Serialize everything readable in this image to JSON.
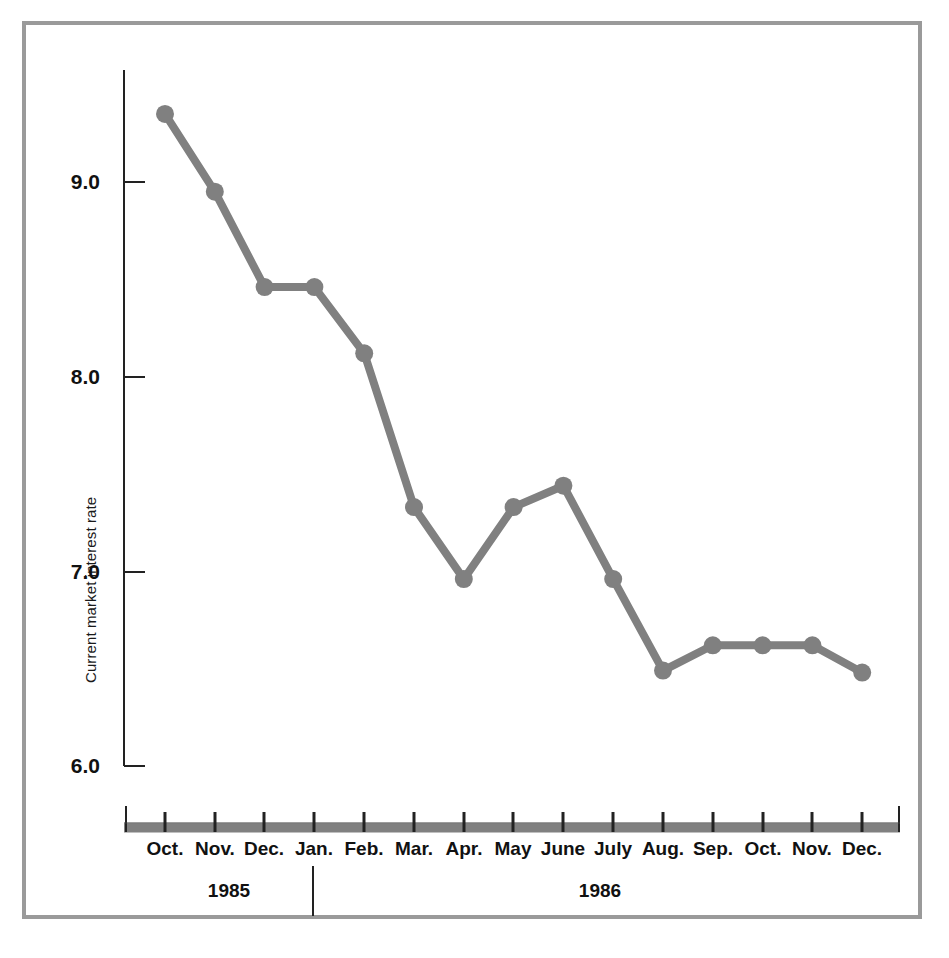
{
  "chart_data": {
    "type": "line",
    "title": "",
    "subtitle": "",
    "xlabel": "",
    "ylabel": "Current market interest rate",
    "categories": [
      "Oct.",
      "Nov.",
      "Dec.",
      "Jan.",
      "Feb.",
      "Mar.",
      "Apr.",
      "May",
      "June",
      "July",
      "Aug.",
      "Sep.",
      "Oct.",
      "Nov.",
      "Dec."
    ],
    "values": [
      9.35,
      8.95,
      8.46,
      8.46,
      8.12,
      7.33,
      6.96,
      7.33,
      7.44,
      6.96,
      6.49,
      6.62,
      6.62,
      6.62,
      6.48
    ],
    "ytick_labels": [
      "9.0",
      "8.0",
      "7.0",
      "6.0"
    ],
    "ytick_values": [
      9.0,
      8.0,
      7.0,
      6.0
    ],
    "ylim": [
      6.0,
      9.6
    ],
    "xlim_labels": [
      "Oct.",
      "Dec."
    ],
    "grid": false,
    "legend": "none",
    "markers": "circle",
    "series": [
      {
        "name": "Current market interest rate",
        "values": [
          9.35,
          8.95,
          8.46,
          8.46,
          8.12,
          7.33,
          6.96,
          7.33,
          7.44,
          6.96,
          6.49,
          6.62,
          6.62,
          6.62,
          6.48
        ]
      }
    ],
    "period_groups": [
      {
        "label": "1985",
        "months": [
          "Oct.",
          "Nov.",
          "Dec."
        ]
      },
      {
        "label": "1986",
        "months": [
          "Jan.",
          "Feb.",
          "Mar.",
          "Apr.",
          "May",
          "June",
          "July",
          "Aug.",
          "Sep.",
          "Oct.",
          "Nov.",
          "Dec."
        ]
      }
    ]
  },
  "axis": {
    "y_title": "Current market interest rate",
    "y_ticks": [
      {
        "label": "9.0"
      },
      {
        "label": "8.0"
      },
      {
        "label": "7.0"
      },
      {
        "label": "6.0"
      }
    ],
    "x_ticks": [
      {
        "label": "Oct."
      },
      {
        "label": "Nov."
      },
      {
        "label": "Dec."
      },
      {
        "label": "Jan."
      },
      {
        "label": "Feb."
      },
      {
        "label": "Mar."
      },
      {
        "label": "Apr."
      },
      {
        "label": "May"
      },
      {
        "label": "June"
      },
      {
        "label": "July"
      },
      {
        "label": "Aug."
      },
      {
        "label": "Sep."
      },
      {
        "label": "Oct."
      },
      {
        "label": "Nov."
      },
      {
        "label": "Dec."
      }
    ]
  },
  "years": [
    {
      "label": "1985"
    },
    {
      "label": "1986"
    }
  ],
  "colors": {
    "series_line": "#808080",
    "axis": "#222222",
    "frame": "#9a9a9a",
    "x_axis_band": "#808080",
    "text": "#111111",
    "background": "#ffffff"
  }
}
